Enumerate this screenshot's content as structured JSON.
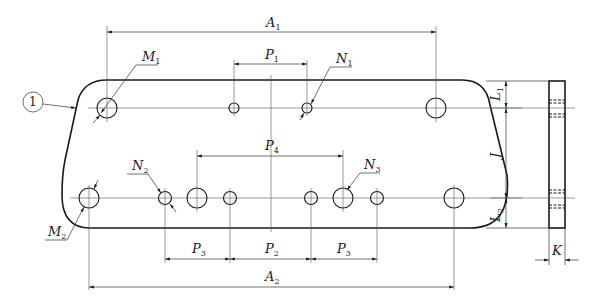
{
  "diagram": {
    "type": "engineering-drawing",
    "callout": "1",
    "labels": {
      "A1": {
        "main": "A",
        "sub": "1"
      },
      "A2": {
        "main": "A",
        "sub": "2"
      },
      "P1": {
        "main": "P",
        "sub": "1"
      },
      "P2": {
        "main": "P",
        "sub": "2"
      },
      "P3a": {
        "main": "P",
        "sub": "3"
      },
      "P3b": {
        "main": "P",
        "sub": "3"
      },
      "P4": {
        "main": "P",
        "sub": "4"
      },
      "M1": {
        "main": "M",
        "sub": "1"
      },
      "M2": {
        "main": "M",
        "sub": "2"
      },
      "N1": {
        "main": "N",
        "sub": "1"
      },
      "N2": {
        "main": "N",
        "sub": "2"
      },
      "N3": {
        "main": "N",
        "sub": "3"
      },
      "L1": {
        "main": "L",
        "sub": "1"
      },
      "L2": {
        "main": "L",
        "sub": "2"
      },
      "J": {
        "main": "J"
      },
      "K": {
        "main": "K"
      }
    },
    "colors": {
      "line": "#1a1a1a",
      "background": "#ffffff"
    }
  }
}
